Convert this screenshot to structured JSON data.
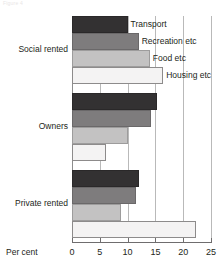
{
  "figure": {
    "caption": "Figure 4"
  },
  "chart_data": {
    "type": "bar",
    "orientation": "horizontal",
    "title": "",
    "xlabel": "Per cent",
    "ylabel": "",
    "xlim": [
      0,
      25
    ],
    "xticks": [
      0,
      5,
      10,
      15,
      20,
      25
    ],
    "grid": true,
    "legend_position": "inline-labels",
    "categories": [
      "Social rented",
      "Owners",
      "Private rented"
    ],
    "series": [
      {
        "name": "Transport",
        "color": "#333132",
        "values": [
          10.0,
          15.2,
          12.0
        ]
      },
      {
        "name": "Recreation etc",
        "color": "#7e7c7d",
        "values": [
          12.0,
          14.2,
          11.6
        ]
      },
      {
        "name": "Food etc",
        "color": "#c3c2c2",
        "values": [
          14.0,
          10.0,
          8.8
        ]
      },
      {
        "name": "Housing etc",
        "color": "#f4f3f3",
        "values": [
          16.4,
          6.2,
          22.3
        ]
      }
    ],
    "annotations": [
      {
        "text": "Transport",
        "series": "Transport"
      },
      {
        "text": "Recreation etc",
        "series": "Recreation etc"
      },
      {
        "text": "Food etc",
        "series": "Food etc"
      },
      {
        "text": "Housing etc",
        "series": "Housing etc"
      }
    ]
  },
  "axis": {
    "tick_labels": [
      "0",
      "5",
      "10",
      "15",
      "20",
      "25"
    ],
    "title": "Per cent"
  }
}
